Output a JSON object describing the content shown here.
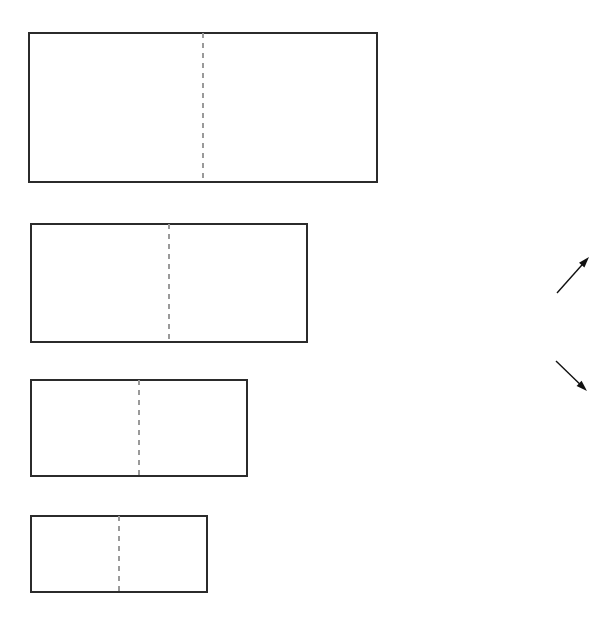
{
  "figure": {
    "background_color": "#ffffff",
    "stroke_color": "#2b2b2b",
    "fold_line_color": "#9a9a9a",
    "arrow_color": "#111111",
    "canvas": {
      "width": 612,
      "height": 618
    },
    "rectangles": [
      {
        "name": "rectangle-1",
        "x": 29,
        "y": 33,
        "width": 348,
        "height": 149,
        "fold_line_x": 203,
        "fold_line_style": "dashed",
        "orientation": "vertical"
      },
      {
        "name": "rectangle-2",
        "x": 31,
        "y": 224,
        "width": 276,
        "height": 118,
        "fold_line_x": 169,
        "fold_line_style": "dashed",
        "orientation": "vertical"
      },
      {
        "name": "rectangle-3",
        "x": 31,
        "y": 380,
        "width": 216,
        "height": 96,
        "fold_line_x": 139,
        "fold_line_style": "dashed",
        "orientation": "vertical"
      },
      {
        "name": "rectangle-4",
        "x": 31,
        "y": 516,
        "width": 176,
        "height": 76,
        "fold_line_x": 119,
        "fold_line_style": "dashed",
        "orientation": "vertical"
      }
    ],
    "arrows": [
      {
        "name": "arrow-up-right",
        "x1": 557,
        "y1": 293,
        "x2": 589,
        "y2": 257,
        "direction": "up-right"
      },
      {
        "name": "arrow-down-right",
        "x1": 556,
        "y1": 361,
        "x2": 587,
        "y2": 391,
        "direction": "down-right"
      }
    ]
  }
}
